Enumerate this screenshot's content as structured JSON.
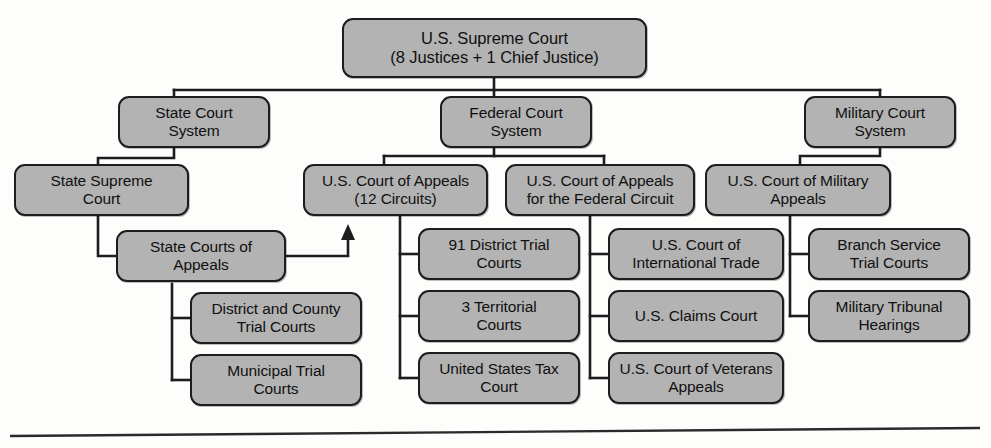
{
  "diagram": {
    "type": "organizational-hierarchy",
    "colors": {
      "node_fill": "#b3b3b3",
      "node_border": "#1d1d1d",
      "connector": "#1d1d1d",
      "background": "#fdfdfc",
      "text": "#101010"
    },
    "nodes": {
      "supreme_court": "U.S. Supreme Court\n(8 Justices + 1 Chief Justice)",
      "state_court_system": "State Court\nSystem",
      "federal_court_system": "Federal Court\nSystem",
      "military_court_system": "Military Court\nSystem",
      "state_supreme_court": "State Supreme\nCourt",
      "us_court_of_appeals_circuits": "U.S. Court of Appeals\n(12 Circuits)",
      "us_court_of_appeals_federal_circuit": "U.S. Court of Appeals\nfor the Federal Circuit",
      "us_court_of_military_appeals": "U.S. Court of Military\nAppeals",
      "state_courts_of_appeals": "State Courts of\nAppeals",
      "district_trial_courts": "91 District Trial\nCourts",
      "court_of_international_trade": "U.S. Court of\nInternational Trade",
      "branch_service_trial_courts": "Branch Service\nTrial Courts",
      "district_and_county_trial_courts": "District and County\nTrial Courts",
      "territorial_courts": "3 Territorial\nCourts",
      "us_claims_court": "U.S. Claims Court",
      "military_tribunal_hearings": "Military Tribunal\nHearings",
      "municipal_trial_courts": "Municipal Trial\nCourts",
      "united_states_tax_court": "United States Tax\nCourt",
      "court_of_veterans_appeals": "U.S. Court of Veterans\nAppeals"
    },
    "edges": [
      {
        "from": "supreme_court",
        "to": "state_court_system",
        "style": "elbow"
      },
      {
        "from": "supreme_court",
        "to": "federal_court_system",
        "style": "straight"
      },
      {
        "from": "supreme_court",
        "to": "military_court_system",
        "style": "elbow"
      },
      {
        "from": "state_court_system",
        "to": "state_supreme_court",
        "style": "elbow"
      },
      {
        "from": "federal_court_system",
        "to": "us_court_of_appeals_circuits",
        "style": "elbow"
      },
      {
        "from": "federal_court_system",
        "to": "us_court_of_appeals_federal_circuit",
        "style": "elbow"
      },
      {
        "from": "military_court_system",
        "to": "us_court_of_military_appeals",
        "style": "elbow"
      },
      {
        "from": "state_supreme_court",
        "to": "state_courts_of_appeals",
        "style": "elbow"
      },
      {
        "from": "state_courts_of_appeals",
        "to": "district_and_county_trial_courts",
        "style": "elbow"
      },
      {
        "from": "state_courts_of_appeals",
        "to": "municipal_trial_courts",
        "style": "elbow"
      },
      {
        "from": "state_courts_of_appeals",
        "to": "us_court_of_appeals_circuits",
        "style": "arrow-up"
      },
      {
        "from": "us_court_of_appeals_circuits",
        "to": "district_trial_courts",
        "style": "elbow"
      },
      {
        "from": "us_court_of_appeals_circuits",
        "to": "territorial_courts",
        "style": "elbow"
      },
      {
        "from": "us_court_of_appeals_circuits",
        "to": "united_states_tax_court",
        "style": "elbow"
      },
      {
        "from": "us_court_of_appeals_federal_circuit",
        "to": "court_of_international_trade",
        "style": "elbow"
      },
      {
        "from": "us_court_of_appeals_federal_circuit",
        "to": "us_claims_court",
        "style": "elbow"
      },
      {
        "from": "us_court_of_appeals_federal_circuit",
        "to": "court_of_veterans_appeals",
        "style": "elbow"
      },
      {
        "from": "us_court_of_military_appeals",
        "to": "branch_service_trial_courts",
        "style": "elbow"
      },
      {
        "from": "us_court_of_military_appeals",
        "to": "military_tribunal_hearings",
        "style": "elbow"
      }
    ]
  }
}
